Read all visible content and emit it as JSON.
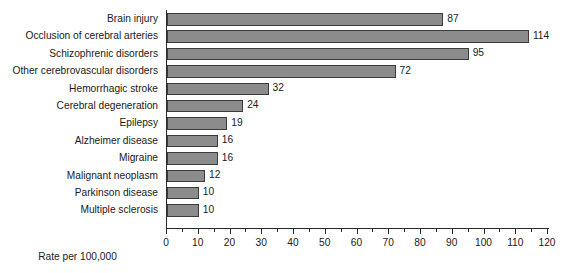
{
  "chart_data": {
    "type": "bar",
    "orientation": "horizontal",
    "title": "",
    "xlabel": "Rate per 100,000",
    "ylabel": "",
    "xlim": [
      0,
      120
    ],
    "xticks": [
      0,
      10,
      20,
      30,
      40,
      50,
      60,
      70,
      80,
      90,
      100,
      110,
      120
    ],
    "minor_ticks": [
      5,
      15,
      25,
      35,
      45,
      55,
      65,
      75,
      85,
      95,
      105,
      115
    ],
    "grid": false,
    "legend": "none",
    "categories": [
      "Brain injury",
      "Occlusion of cerebral arteries",
      "Schizophrenic disorders",
      "Other cerebrovascular disorders",
      "Hemorrhagic stroke",
      "Cerebral degeneration",
      "Epilepsy",
      "Alzheimer disease",
      "Migraine",
      "Malignant neoplasm",
      "Parkinson disease",
      "Multiple sclerosis"
    ],
    "values": [
      87,
      114,
      95,
      72,
      32,
      24,
      19,
      16,
      16,
      12,
      10,
      10
    ],
    "value_labels": [
      "87",
      "114",
      "95",
      "72",
      "32",
      "24",
      "19",
      "16",
      "16",
      "12",
      "10",
      "10"
    ],
    "bar_color": "#8c8c8c",
    "bar_border_color": "#3b3b3b",
    "axis_color": "#2b2b2b",
    "text_color": "#1a1a1a"
  }
}
